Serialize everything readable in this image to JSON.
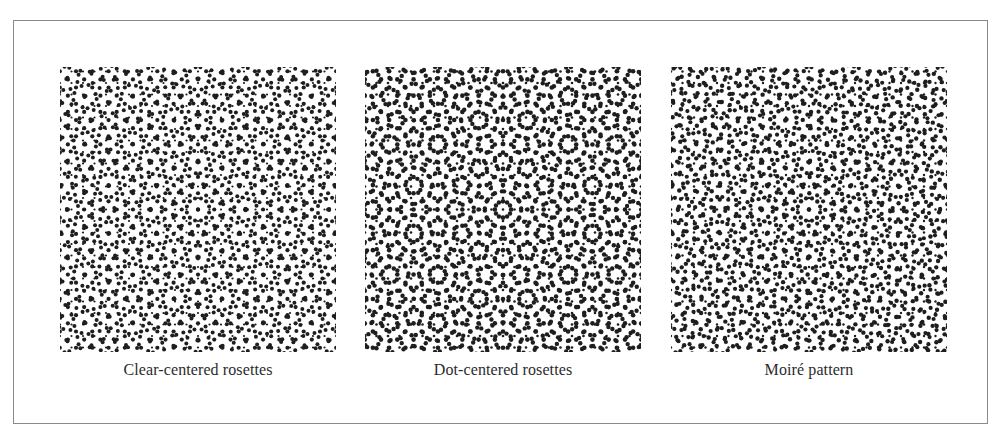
{
  "figure": {
    "panels": [
      {
        "id": "clear-centered",
        "caption": "Clear-centered rosettes",
        "pattern": {
          "style": "clear",
          "spacing": 11.5,
          "angle": 0,
          "ink": "#1e1e1e"
        }
      },
      {
        "id": "dot-centered",
        "caption": "Dot-centered rosettes",
        "pattern": {
          "style": "dot",
          "spacing": 11.5,
          "angle": 0,
          "ink": "#1e1e1e"
        }
      },
      {
        "id": "moire",
        "caption": "Moiré pattern",
        "pattern": {
          "style": "moire",
          "spacing": 11.5,
          "angle": 1.2,
          "ink": "#1e1e1e"
        }
      }
    ]
  },
  "colors": {
    "frame_border": "#8a8a8a",
    "background": "#ffffff",
    "caption_text": "#2b2b2b"
  }
}
